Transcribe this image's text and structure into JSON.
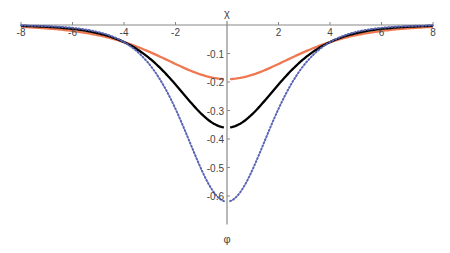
{
  "chart_data": {
    "type": "line",
    "title": "",
    "xlabel": "χ",
    "ylabel": "φ",
    "xlim": [
      -8,
      8
    ],
    "ylim": [
      -0.7,
      0
    ],
    "grid": false,
    "legend": null,
    "x_ticks": [
      -8,
      -6,
      -4,
      -2,
      2,
      4,
      6,
      8
    ],
    "x_tick_labels": [
      "-8",
      "-6",
      "-4",
      "-2",
      "2",
      "4",
      "6",
      "8"
    ],
    "y_ticks": [
      -0.1,
      -0.2,
      -0.3,
      -0.4,
      -0.5,
      -0.6
    ],
    "y_tick_labels": [
      "-0.1",
      "-0.2",
      "-0.3",
      "-0.4",
      "-0.5",
      "-0.6"
    ],
    "series": [
      {
        "name": "orange-solid",
        "color": "#f07850",
        "style": "solid",
        "x": [
          -8,
          -6,
          -5,
          -4,
          -3,
          -2,
          -1,
          -0.1,
          0.1,
          1,
          2,
          3,
          4,
          5,
          6,
          8
        ],
        "y": [
          -0.005,
          -0.02,
          -0.035,
          -0.06,
          -0.09,
          -0.13,
          -0.17,
          -0.19,
          -0.19,
          -0.17,
          -0.13,
          -0.09,
          -0.06,
          -0.035,
          -0.02,
          -0.005
        ]
      },
      {
        "name": "black-solid",
        "color": "#000000",
        "style": "solid",
        "x": [
          -8,
          -6,
          -5,
          -4,
          -3,
          -2,
          -1,
          -0.1,
          0.1,
          1,
          2,
          3,
          4,
          5,
          6,
          8
        ],
        "y": [
          -0.003,
          -0.015,
          -0.03,
          -0.06,
          -0.13,
          -0.24,
          -0.33,
          -0.36,
          -0.36,
          -0.33,
          -0.24,
          -0.13,
          -0.06,
          -0.03,
          -0.015,
          -0.003
        ]
      },
      {
        "name": "blue-dotted",
        "color": "#5a64b4",
        "style": "dotted",
        "x": [
          -8,
          -6,
          -5,
          -4,
          -3,
          -2,
          -1,
          -0.1,
          0.1,
          1,
          2,
          3,
          4,
          5,
          6,
          8
        ],
        "y": [
          -0.001,
          -0.01,
          -0.025,
          -0.06,
          -0.17,
          -0.37,
          -0.55,
          -0.62,
          -0.62,
          -0.55,
          -0.37,
          -0.17,
          -0.06,
          -0.025,
          -0.01,
          -0.001
        ]
      }
    ]
  }
}
